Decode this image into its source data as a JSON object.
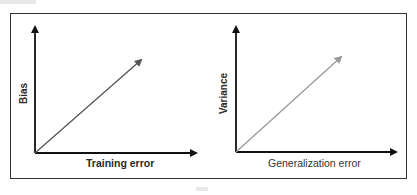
{
  "panels": [
    {
      "id": "bias",
      "y_label": "Bias",
      "x_label": "Training error",
      "arrow_color": "#555555",
      "relationship": "increasing-linear"
    },
    {
      "id": "variance",
      "y_label": "Variance",
      "x_label": "Generalization error",
      "arrow_color": "#9a9a9a",
      "relationship": "increasing-linear"
    }
  ],
  "colors": {
    "axis": "#111111",
    "frame": "#333333"
  }
}
